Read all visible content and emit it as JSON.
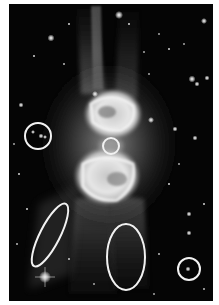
{
  "image": {
    "subject": "Bipolar planetary nebula with surrounding star field",
    "alt": "Grayscale astronomical image of a bipolar nebula with white circles and ellipses marking regions of interest",
    "colors": {
      "background": "#050505",
      "border": "#ffffff",
      "annotation": "#f2f2f2",
      "nebula_core": "#e8e8e8"
    }
  },
  "annotations": [
    {
      "id": "left-circle",
      "shape": "circle",
      "cx": 29,
      "cy": 132,
      "rx": 13,
      "ry": 13,
      "rotate": 0
    },
    {
      "id": "center-circle",
      "shape": "circle",
      "cx": 102,
      "cy": 142,
      "rx": 8,
      "ry": 8,
      "rotate": 0
    },
    {
      "id": "left-ellipse",
      "shape": "ellipse",
      "cx": 41,
      "cy": 231,
      "rx": 10,
      "ry": 35,
      "rotate": 27
    },
    {
      "id": "bottom-center-ellipse",
      "shape": "ellipse",
      "cx": 117,
      "cy": 253,
      "rx": 19,
      "ry": 33,
      "rotate": 0
    },
    {
      "id": "right-circle",
      "shape": "circle",
      "cx": 180,
      "cy": 265,
      "rx": 11,
      "ry": 11,
      "rotate": 0
    }
  ]
}
